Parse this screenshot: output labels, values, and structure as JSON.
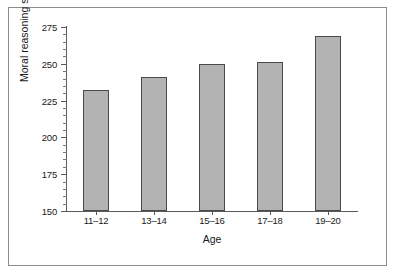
{
  "chart_data": {
    "type": "bar",
    "title": "",
    "subtitle": "",
    "xlabel": "Age",
    "ylabel": "Moral reasoning score",
    "categories": [
      "11–12",
      "13–14",
      "15–16",
      "17–18",
      "19–20"
    ],
    "values": [
      232,
      241,
      250,
      251,
      269
    ],
    "series": [
      {
        "name": "Moral reasoning score",
        "values": [
          232,
          241,
          250,
          251,
          269
        ]
      }
    ],
    "ylim": [
      150,
      275
    ],
    "xlim": [
      0,
      5
    ],
    "ytick_labels": [
      "150",
      "175",
      "200",
      "225",
      "250",
      "275"
    ],
    "ytick_values": [
      150,
      175,
      200,
      225,
      250,
      275
    ],
    "ytick_minor_step": 5,
    "grid": false,
    "legend": null,
    "legend_position": "none",
    "annotations": [],
    "bar_fill_color": "#b3b3b3",
    "bar_edge_color": "#4a4a4a",
    "axis_color": "#5a5a5a",
    "frame_color": "#8d8d8d",
    "background_color": "#ffffff",
    "text_color": "#1a1a1a"
  }
}
